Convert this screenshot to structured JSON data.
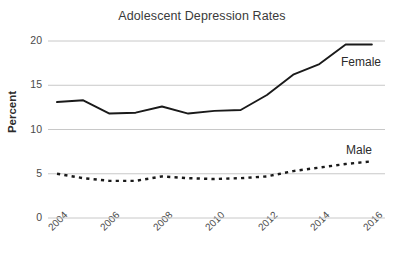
{
  "chart_data": {
    "type": "line",
    "title": "Adolescent Depression Rates",
    "xlabel": "",
    "ylabel": "Percent",
    "x": [
      2004,
      2005,
      2006,
      2007,
      2008,
      2009,
      2010,
      2011,
      2012,
      2013,
      2014,
      2015,
      2016
    ],
    "xlim": [
      2004,
      2016.5
    ],
    "ylim": [
      0,
      20.6
    ],
    "yticks": [
      0,
      5,
      10,
      15,
      20
    ],
    "ytick_labels": [
      "0",
      "5",
      "10",
      "15",
      "20"
    ],
    "xticks": [
      2004,
      2006,
      2008,
      2010,
      2012,
      2014,
      2016
    ],
    "xtick_labels": [
      "2004",
      "2006",
      "2008",
      "2010",
      "2012",
      "2014",
      "2016"
    ],
    "grid": "horizontal",
    "legend_position": "inline-annotation",
    "series": [
      {
        "name": "Female",
        "style": "solid",
        "color": "#1a1a1a",
        "values": [
          13.1,
          13.3,
          11.8,
          11.9,
          12.6,
          11.8,
          12.1,
          12.2,
          13.9,
          16.2,
          17.4,
          19.6,
          19.6
        ]
      },
      {
        "name": "Male",
        "style": "dashed",
        "color": "#1a1a1a",
        "values": [
          5.0,
          4.5,
          4.2,
          4.2,
          4.7,
          4.5,
          4.4,
          4.5,
          4.7,
          5.3,
          5.7,
          6.1,
          6.4
        ]
      }
    ],
    "annotations": [
      {
        "text": "Female",
        "series": "Female"
      },
      {
        "text": "Male",
        "series": "Male"
      }
    ],
    "colors": {
      "line": "#1a1a1a",
      "grid": "#c8c8c8",
      "text": "#3a3a3a",
      "background": "#ffffff"
    }
  }
}
